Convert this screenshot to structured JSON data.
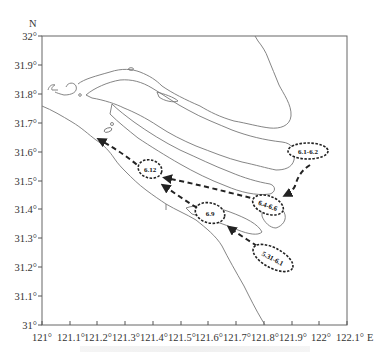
{
  "map": {
    "north_label": "N",
    "east_label": "E",
    "lat_ticks": [
      "32°",
      "31.9°",
      "31.8°",
      "31.7°",
      "31.6°",
      "31.5°",
      "31.4°",
      "31.3°",
      "31.2°",
      "31.1°",
      "31°"
    ],
    "lon_ticks": [
      "121°",
      "121.1°",
      "121.2°",
      "121.3°",
      "121.4°",
      "121.5°",
      "121.6°",
      "121.7°",
      "121.8°",
      "121.9°",
      "122°",
      "122.1°"
    ],
    "lat_range": [
      31.0,
      32.0
    ],
    "lon_range": [
      121.0,
      122.1
    ],
    "colors": {
      "coastline": "#777777",
      "frame": "#666666",
      "path": "#222222"
    },
    "events": [
      {
        "label": "6.1-6.2",
        "position": "offshore east, near 122.0°E 31.58°N"
      },
      {
        "label": "6.4-6.6",
        "position": "near 121.88°E 31.42°N"
      },
      {
        "label": "5.31-6.1",
        "position": "near 121.85°E 31.23°N"
      },
      {
        "label": "6.9",
        "position": "near 121.58°E 31.38°N"
      },
      {
        "label": "6.12",
        "position": "near 121.4°E 31.55°N"
      }
    ],
    "path_arrows": [
      "6.1-6.2 → 6.4-6.6",
      "6.4-6.6 → 6.12",
      "5.31-6.1 → 6.9",
      "6.9 → upstream NW",
      "6.12 → upstream NW"
    ]
  }
}
